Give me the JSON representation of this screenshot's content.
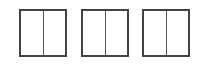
{
  "layout_options": [
    {
      "name": "two-column-layout",
      "columns": 2,
      "selected": false
    },
    {
      "name": "two-column-layout",
      "columns": 2,
      "selected": false
    },
    {
      "name": "two-column-layout",
      "columns": 2,
      "selected": false
    }
  ],
  "colors": {
    "border": "#444444",
    "divider": "#555555",
    "background": "#ffffff"
  }
}
